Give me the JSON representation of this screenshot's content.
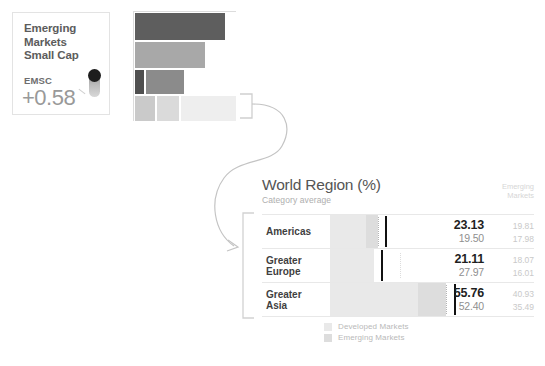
{
  "fund_card": {
    "title": "Emerging\nMarkets\nSmall Cap",
    "title_line1": "Emerging",
    "title_line2": "Markets",
    "title_line3": "Small Cap",
    "ticker": "EMSC",
    "value": "+0.58"
  },
  "treemap": {
    "cells": [
      {
        "x": 0,
        "y": 0,
        "w": 92,
        "h": 29,
        "color": "#5e5e5e"
      },
      {
        "x": 92,
        "y": 0,
        "w": 11,
        "h": 29,
        "color": "#ffffff"
      },
      {
        "x": 0,
        "y": 29,
        "w": 72,
        "h": 28,
        "color": "#a8a8a8"
      },
      {
        "x": 72,
        "y": 29,
        "w": 31,
        "h": 28,
        "color": "#ffffff"
      },
      {
        "x": 0,
        "y": 57,
        "w": 11,
        "h": 26,
        "color": "#4f4f4f"
      },
      {
        "x": 11,
        "y": 57,
        "w": 40,
        "h": 26,
        "color": "#8b8b8b"
      },
      {
        "x": 51,
        "y": 57,
        "w": 52,
        "h": 26,
        "color": "#ffffff"
      },
      {
        "x": 0,
        "y": 83,
        "w": 22,
        "h": 27,
        "color": "#cacaca"
      },
      {
        "x": 22,
        "y": 83,
        "w": 24,
        "h": 27,
        "color": "#dadada"
      },
      {
        "x": 46,
        "y": 83,
        "w": 57,
        "h": 27,
        "color": "#eeeeee"
      }
    ]
  },
  "world_region": {
    "title": "World Region (%)",
    "subtitle": "Category average",
    "column_header_line1": "Emerging",
    "column_header_line2": "Markets",
    "rows": [
      {
        "label_line1": "Americas",
        "label_line2": "",
        "primary": "23.13",
        "secondary": "19.50",
        "em_primary": "19.81",
        "em_secondary": "17.98",
        "developed_width": 36,
        "emerging_width": 12,
        "marker_x": 55,
        "dotted_free_x": null
      },
      {
        "label_line1": "Greater",
        "label_line2": "Europe",
        "primary": "21.11",
        "secondary": "27.97",
        "em_primary": "18.07",
        "em_secondary": "16.01",
        "developed_width": 44,
        "emerging_width": 0,
        "marker_x": 51,
        "dotted_free_x": 70
      },
      {
        "label_line1": "Greater",
        "label_line2": "Asia",
        "primary": "55.76",
        "secondary": "52.40",
        "em_primary": "40.93",
        "em_secondary": "35.49",
        "developed_width": 88,
        "emerging_width": 28,
        "marker_x": 124,
        "dotted_free_x": null
      }
    ],
    "legend": [
      {
        "label": "Developed Markets",
        "color": "#e9e9e9"
      },
      {
        "label": "Emerging Markets",
        "color": "#dddddd"
      }
    ]
  },
  "colors": {
    "accent_dark": "#111111",
    "bar_developed": "#e9e9e9",
    "bar_emerging": "#dddddd",
    "text_primary": "#1f1f1f",
    "text_muted": "#8f8f8f",
    "text_faint": "#c9c9c9"
  }
}
